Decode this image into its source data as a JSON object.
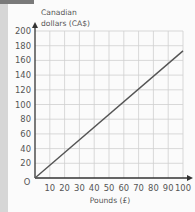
{
  "chart_data": {
    "type": "line",
    "title": "",
    "xlabel": "Pounds (£)",
    "ylabel": "Canadian dollars (CA$)",
    "ylabel_line1": "Canadian",
    "ylabel_line2": "dollars (CA$)",
    "origin_label": "O",
    "x_ticks": [
      "10",
      "20",
      "30",
      "40",
      "50",
      "60",
      "70",
      "80",
      "90",
      "100"
    ],
    "y_ticks": [
      "20",
      "40",
      "60",
      "80",
      "100",
      "120",
      "140",
      "160",
      "180",
      "200"
    ],
    "xlim": [
      0,
      100
    ],
    "ylim": [
      0,
      200
    ],
    "grid": true,
    "series": [
      {
        "name": "Conversion",
        "x": [
          0,
          100
        ],
        "values": [
          0,
          173
        ],
        "color": "#555555"
      }
    ]
  }
}
